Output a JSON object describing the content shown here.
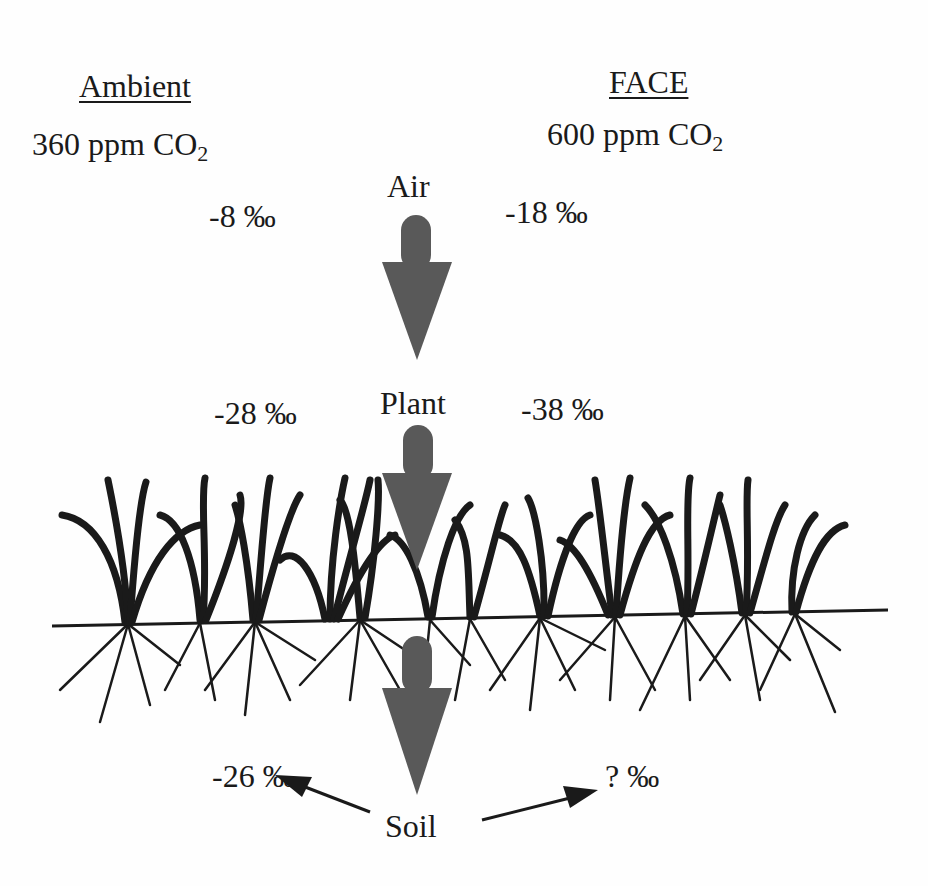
{
  "columns": {
    "ambient": {
      "title": "Ambient",
      "concentration_prefix": "360 ppm CO",
      "concentration_sub": "2"
    },
    "face": {
      "title": "FACE",
      "concentration_prefix": "600 ppm CO",
      "concentration_sub": "2"
    }
  },
  "stages": {
    "air": {
      "label": "Air",
      "ambient_value": "-8 ‰",
      "face_value": "-18 ‰"
    },
    "plant": {
      "label": "Plant",
      "ambient_value": "-28 ‰",
      "face_value": "-38 ‰"
    },
    "soil": {
      "label": "Soil",
      "ambient_value": "-26 ‰",
      "face_value": "? ‰"
    }
  },
  "colors": {
    "arrow": "#595959",
    "ink": "#1a1a1a",
    "background": "#fefefe"
  }
}
